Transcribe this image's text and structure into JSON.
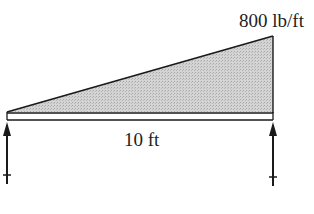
{
  "diagram": {
    "type": "beam-loading",
    "load": {
      "kind": "triangular-distributed",
      "max_intensity_label": "800 lb/ft",
      "max_intensity": 800,
      "unit": "lb/ft",
      "increases_toward": "right"
    },
    "beam": {
      "span_label": "10 ft",
      "span": 10,
      "unit": "ft"
    },
    "supports": [
      {
        "position": "left",
        "reaction": "upward"
      },
      {
        "position": "right",
        "reaction": "upward"
      }
    ],
    "colors": {
      "line": "#1a1a1a",
      "load_fill": "#c8c8c8",
      "background": "#ffffff"
    }
  }
}
